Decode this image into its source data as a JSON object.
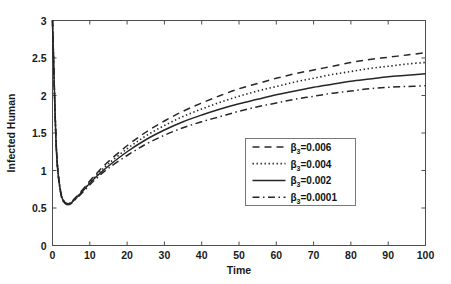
{
  "chart_data": {
    "type": "line",
    "title": "",
    "xlabel": "Time",
    "ylabel": "Infected Human",
    "xlim": [
      0,
      100
    ],
    "ylim": [
      0,
      3
    ],
    "xticks": [
      0,
      10,
      20,
      30,
      40,
      50,
      60,
      70,
      80,
      90,
      100
    ],
    "xtick_labels": [
      "0",
      "10",
      "20",
      "30",
      "40",
      "50",
      "60",
      "70",
      "80",
      "90",
      "100"
    ],
    "yticks": [
      0,
      0.5,
      1,
      1.5,
      2,
      2.5,
      3
    ],
    "ytick_labels": [
      "0",
      "0.5",
      "1",
      "1.5",
      "2",
      "2.5",
      "3"
    ],
    "grid": false,
    "legend_position": "center-right",
    "x": [
      0,
      1,
      2,
      3,
      4,
      5,
      6,
      8,
      10,
      12,
      15,
      20,
      25,
      30,
      35,
      40,
      45,
      50,
      55,
      60,
      65,
      70,
      75,
      80,
      85,
      90,
      95,
      100
    ],
    "series": [
      {
        "name": "beta3-0.006",
        "label_base": "β",
        "label_sub": "3",
        "label_value": "=0.006",
        "style": "dashed",
        "color": "#262626",
        "values": [
          3.0,
          1.35,
          0.78,
          0.6,
          0.56,
          0.58,
          0.63,
          0.74,
          0.86,
          0.97,
          1.12,
          1.33,
          1.51,
          1.66,
          1.79,
          1.9,
          2.0,
          2.09,
          2.16,
          2.23,
          2.29,
          2.34,
          2.39,
          2.44,
          2.48,
          2.51,
          2.54,
          2.57
        ]
      },
      {
        "name": "beta3-0.004",
        "label_base": "β",
        "label_sub": "3",
        "label_value": "=0.004",
        "style": "dotted",
        "color": "#262626",
        "values": [
          3.0,
          1.34,
          0.77,
          0.59,
          0.555,
          0.575,
          0.62,
          0.73,
          0.845,
          0.95,
          1.09,
          1.29,
          1.46,
          1.6,
          1.72,
          1.82,
          1.91,
          1.99,
          2.06,
          2.12,
          2.18,
          2.23,
          2.28,
          2.32,
          2.36,
          2.39,
          2.42,
          2.44
        ]
      },
      {
        "name": "beta3-0.002",
        "label_base": "β",
        "label_sub": "3",
        "label_value": "=0.002",
        "style": "solid",
        "color": "#262626",
        "values": [
          3.0,
          1.33,
          0.765,
          0.585,
          0.55,
          0.57,
          0.615,
          0.72,
          0.83,
          0.93,
          1.06,
          1.25,
          1.41,
          1.54,
          1.65,
          1.74,
          1.82,
          1.89,
          1.95,
          2.01,
          2.06,
          2.11,
          2.15,
          2.19,
          2.22,
          2.25,
          2.27,
          2.29
        ]
      },
      {
        "name": "beta3-0.0001",
        "label_base": "β",
        "label_sub": "3",
        "label_value": "=0.0001",
        "style": "dashdot",
        "color": "#262626",
        "values": [
          3.0,
          1.32,
          0.755,
          0.575,
          0.545,
          0.56,
          0.605,
          0.705,
          0.81,
          0.905,
          1.03,
          1.2,
          1.35,
          1.47,
          1.57,
          1.65,
          1.72,
          1.79,
          1.85,
          1.9,
          1.95,
          1.99,
          2.03,
          2.06,
          2.09,
          2.11,
          2.12,
          2.13
        ]
      }
    ]
  }
}
